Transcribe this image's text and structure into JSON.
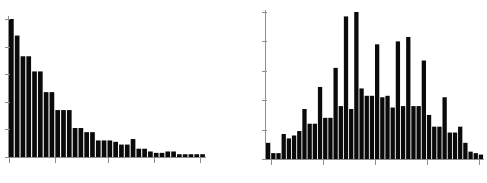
{
  "figure": {
    "title": "",
    "background_color": "#ffffff",
    "panel_count": 2,
    "bar_color": "#0a0a0a",
    "axis_color": "#8e8e8e"
  },
  "chart_data": [
    {
      "type": "bar",
      "name": "left-histogram",
      "title": "",
      "xlabel": "",
      "ylabel": "",
      "grid": false,
      "legend": false,
      "xlim": [
        0,
        34
      ],
      "ylim": [
        0,
        100
      ],
      "x_tick_positions": [
        0,
        8,
        17,
        25,
        33
      ],
      "y_tick_positions": [
        0,
        20,
        40,
        60,
        80,
        100
      ],
      "x_tick_labels": [
        "",
        "",
        "",
        "",
        ""
      ],
      "y_tick_labels": [
        "",
        "",
        "",
        "",
        "",
        ""
      ],
      "categories": [
        "0",
        "1",
        "2",
        "3",
        "4",
        "5",
        "6",
        "7",
        "8",
        "9",
        "10",
        "11",
        "12",
        "13",
        "14",
        "15",
        "16",
        "17",
        "18",
        "19",
        "20",
        "21",
        "22",
        "23",
        "24",
        "25",
        "26",
        "27",
        "28",
        "29",
        "30",
        "31",
        "32",
        "33"
      ],
      "values": [
        100,
        88,
        73,
        73,
        62,
        62,
        47,
        47,
        34,
        34,
        34,
        21,
        21,
        18,
        18,
        12,
        12,
        12,
        11,
        9,
        9,
        13,
        6,
        6,
        4,
        3,
        3,
        4,
        4,
        2,
        2,
        2,
        2,
        2
      ]
    },
    {
      "type": "bar",
      "name": "right-histogram",
      "title": "",
      "xlabel": "",
      "ylabel": "",
      "grid": false,
      "legend": false,
      "xlim": [
        0,
        42
      ],
      "ylim": [
        0,
        100
      ],
      "x_tick_positions": [
        1,
        11,
        21,
        31,
        41
      ],
      "y_tick_positions": [
        0,
        20,
        40,
        60,
        80,
        100
      ],
      "x_tick_labels": [
        "",
        "",
        "",
        "",
        ""
      ],
      "y_tick_labels": [
        "",
        "",
        "",
        "",
        "",
        ""
      ],
      "categories": [
        "0",
        "1",
        "2",
        "3",
        "4",
        "5",
        "6",
        "7",
        "8",
        "9",
        "10",
        "11",
        "12",
        "13",
        "14",
        "15",
        "16",
        "17",
        "18",
        "19",
        "20",
        "21",
        "22",
        "23",
        "24",
        "25",
        "26",
        "27",
        "28",
        "29",
        "30",
        "31",
        "32",
        "33",
        "34",
        "35",
        "36",
        "37",
        "38",
        "39",
        "40",
        "41"
      ],
      "values": [
        11,
        4,
        4,
        17,
        14,
        16,
        19,
        34,
        24,
        24,
        49,
        28,
        28,
        62,
        36,
        97,
        34,
        100,
        48,
        43,
        43,
        78,
        42,
        43,
        35,
        80,
        36,
        83,
        36,
        36,
        67,
        30,
        22,
        22,
        42,
        18,
        18,
        22,
        11,
        5,
        4,
        3
      ]
    }
  ]
}
